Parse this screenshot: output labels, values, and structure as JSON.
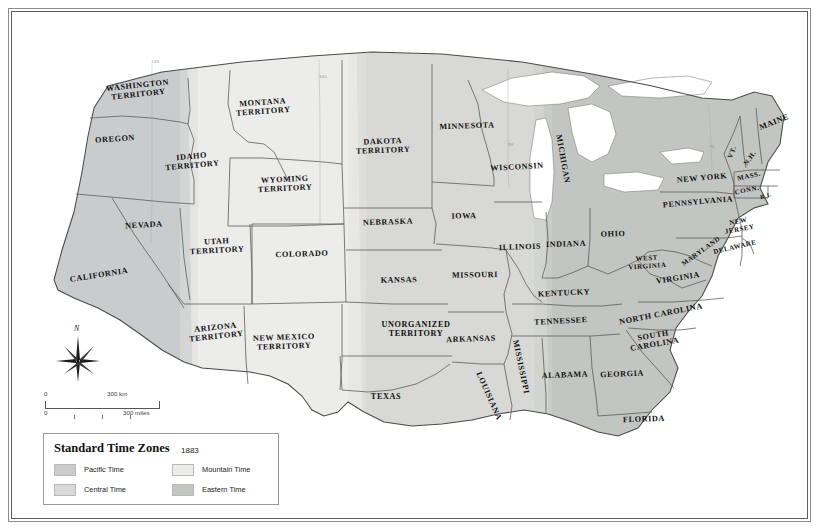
{
  "legend": {
    "title": "Standard Time Zones",
    "year": "1883",
    "entries": [
      {
        "label": "Pacific Time",
        "color": "#c9cbcc"
      },
      {
        "label": "Mountain Time",
        "color": "#ececea"
      },
      {
        "label": "Central Time",
        "color": "#d8d9d6"
      },
      {
        "label": "Eastern Time",
        "color": "#c3c5c2"
      }
    ]
  },
  "scale_bar": {
    "km_zero": "0",
    "km_value": "300 km",
    "miles_zero": "0",
    "miles_value": "300 miles"
  },
  "compass": {
    "north_label": "N"
  },
  "meridians": [
    {
      "label": "120",
      "x": 139,
      "y": 47
    },
    {
      "label": "105",
      "x": 307,
      "y": 62
    },
    {
      "label": "90",
      "x": 496,
      "y": 130
    },
    {
      "label": "75",
      "x": 697,
      "y": 132
    }
  ],
  "colors": {
    "ocean": "#ffffff",
    "pacific": "#c9cbcc",
    "mountain": "#ececea",
    "central": "#d8d9d6",
    "eastern": "#c3c5c2",
    "border": "#5a5a5a",
    "frame_outer": "#8c8c8c",
    "frame_inner": "#5d5d5d",
    "label_text": "#111111"
  },
  "chart_data": {
    "type": "map",
    "title": "Standard Time Zones 1883",
    "projection": "conic (contiguous United States)",
    "zones": [
      {
        "name": "Pacific Time",
        "color": "#c9cbcc",
        "members": [
          "Washington Territory",
          "Oregon",
          "California",
          "Nevada (western)"
        ]
      },
      {
        "name": "Mountain Time",
        "color": "#ececea",
        "members": [
          "Idaho Territory",
          "Montana Territory",
          "Wyoming Territory",
          "Utah Territory",
          "Colorado",
          "Arizona Territory",
          "New Mexico Territory",
          "Nevada (eastern)"
        ]
      },
      {
        "name": "Central Time",
        "color": "#d8d9d6",
        "members": [
          "Dakota Territory",
          "Nebraska",
          "Kansas",
          "Unorganized Territory",
          "Texas",
          "Minnesota",
          "Iowa",
          "Missouri",
          "Arkansas",
          "Louisiana",
          "Wisconsin",
          "Illinois",
          "Mississippi",
          "Alabama"
        ]
      },
      {
        "name": "Eastern Time",
        "color": "#c3c5c2",
        "members": [
          "Michigan",
          "Indiana",
          "Ohio",
          "Kentucky",
          "Tennessee",
          "Georgia",
          "Florida",
          "South Carolina",
          "North Carolina",
          "Virginia",
          "West Virginia",
          "Maryland",
          "Delaware",
          "Pennsylvania",
          "New Jersey",
          "New York",
          "Connecticut",
          "Rhode Island",
          "Massachusetts",
          "Vermont",
          "New Hampshire",
          "Maine"
        ]
      }
    ],
    "meridian_ticks": [
      "120",
      "105",
      "90",
      "75"
    ],
    "scale": {
      "km": 300,
      "miles": 300
    }
  },
  "regions": [
    {
      "name": "WASHINGTON\nTERRITORY",
      "x": 126,
      "y": 78,
      "rot": -6,
      "size": "sz"
    },
    {
      "name": "OREGON",
      "x": 103,
      "y": 127,
      "rot": -4,
      "size": "sz"
    },
    {
      "name": "IDAHO\nTERRITORY",
      "x": 180,
      "y": 149,
      "rot": -5,
      "size": "sz"
    },
    {
      "name": "MONTANA\nTERRITORY",
      "x": 251,
      "y": 95,
      "rot": -4,
      "size": "sz"
    },
    {
      "name": "WYOMING\nTERRITORY",
      "x": 273,
      "y": 172,
      "rot": -3,
      "size": "sz"
    },
    {
      "name": "NEVADA",
      "x": 132,
      "y": 213,
      "rot": -3,
      "size": "sz"
    },
    {
      "name": "CALIFORNIA",
      "x": 87,
      "y": 263,
      "rot": -9,
      "size": "sz"
    },
    {
      "name": "UTAH\nTERRITORY",
      "x": 205,
      "y": 234,
      "rot": -3,
      "size": "sz"
    },
    {
      "name": "COLORADO",
      "x": 290,
      "y": 242,
      "rot": -2,
      "size": "sz"
    },
    {
      "name": "ARIZONA\nTERRITORY",
      "x": 204,
      "y": 320,
      "rot": -6,
      "size": "sz"
    },
    {
      "name": "NEW MEXICO\nTERRITORY",
      "x": 272,
      "y": 330,
      "rot": -2,
      "size": "sz"
    },
    {
      "name": "DAKOTA\nTERRITORY",
      "x": 371,
      "y": 134,
      "rot": -2,
      "size": "sz"
    },
    {
      "name": "NEBRASKA",
      "x": 376,
      "y": 210,
      "rot": -2,
      "size": "sz"
    },
    {
      "name": "KANSAS",
      "x": 387,
      "y": 268,
      "rot": -1,
      "size": "sz"
    },
    {
      "name": "UNORGANIZED\nTERRITORY",
      "x": 404,
      "y": 317,
      "rot": 0,
      "size": "sz"
    },
    {
      "name": "TEXAS",
      "x": 374,
      "y": 385,
      "rot": 0,
      "size": "sz"
    },
    {
      "name": "MINNESOTA",
      "x": 455,
      "y": 114,
      "rot": -2,
      "size": "sz"
    },
    {
      "name": "IOWA",
      "x": 452,
      "y": 204,
      "rot": -1,
      "size": "sz"
    },
    {
      "name": "MISSOURI",
      "x": 463,
      "y": 263,
      "rot": -1,
      "size": "sz"
    },
    {
      "name": "ARKANSAS",
      "x": 459,
      "y": 327,
      "rot": -2,
      "size": "sz"
    },
    {
      "name": "WISCONSIN",
      "x": 505,
      "y": 155,
      "rot": -3,
      "size": "sz"
    },
    {
      "name": "ILLINOIS",
      "x": 508,
      "y": 235,
      "rot": -2,
      "size": "sz"
    },
    {
      "name": "INDIANA",
      "x": 554,
      "y": 232,
      "rot": -2,
      "size": "sz"
    },
    {
      "name": "MICHIGAN",
      "x": 551,
      "y": 147,
      "rot": 80,
      "size": "sz"
    },
    {
      "name": "OHIO",
      "x": 601,
      "y": 222,
      "rot": -2,
      "size": "sz"
    },
    {
      "name": "KENTUCKY",
      "x": 552,
      "y": 281,
      "rot": -3,
      "size": "sz"
    },
    {
      "name": "TENNESSEE",
      "x": 549,
      "y": 309,
      "rot": -3,
      "size": "sz"
    },
    {
      "name": "MISSISSIPPI",
      "x": 509,
      "y": 355,
      "rot": 78,
      "size": "sz"
    },
    {
      "name": "LOUISIANA",
      "x": 477,
      "y": 384,
      "rot": 66,
      "size": "sz"
    },
    {
      "name": "ALABAMA",
      "x": 553,
      "y": 363,
      "rot": -2,
      "size": "sz"
    },
    {
      "name": "GEORGIA",
      "x": 610,
      "y": 362,
      "rot": -2,
      "size": "sz"
    },
    {
      "name": "FLORIDA",
      "x": 632,
      "y": 407,
      "rot": -2,
      "size": "sz"
    },
    {
      "name": "SOUTH\nCAROLINA",
      "x": 642,
      "y": 328,
      "rot": -10,
      "size": "sz"
    },
    {
      "name": "NORTH CAROLINA",
      "x": 649,
      "y": 302,
      "rot": -11,
      "size": "sz"
    },
    {
      "name": "VIRGINIA",
      "x": 666,
      "y": 266,
      "rot": -9,
      "size": "sz"
    },
    {
      "name": "WEST\nVIRGINIA",
      "x": 635,
      "y": 250,
      "rot": -4,
      "size": "sz-sm"
    },
    {
      "name": "MARYLAND",
      "x": 689,
      "y": 239,
      "rot": -36,
      "size": "sz-sm"
    },
    {
      "name": "DELAWARE",
      "x": 723,
      "y": 235,
      "rot": -13,
      "size": "sz-sm"
    },
    {
      "name": "PENNSYLVANIA",
      "x": 686,
      "y": 190,
      "rot": -5,
      "size": "sz"
    },
    {
      "name": "NEW\nJERSEY",
      "x": 727,
      "y": 213,
      "rot": -10,
      "size": "sz-sm"
    },
    {
      "name": "NEW YORK",
      "x": 690,
      "y": 166,
      "rot": -5,
      "size": "sz"
    },
    {
      "name": "VT.",
      "x": 720,
      "y": 140,
      "rot": -68,
      "size": "sz-sm"
    },
    {
      "name": "N.H.",
      "x": 738,
      "y": 146,
      "rot": -54,
      "size": "sz-sm"
    },
    {
      "name": "MAINE",
      "x": 762,
      "y": 110,
      "rot": -22,
      "size": "sz"
    },
    {
      "name": "MASS.",
      "x": 737,
      "y": 164,
      "rot": -12,
      "size": "sz-sm"
    },
    {
      "name": "CONN.",
      "x": 735,
      "y": 178,
      "rot": -12,
      "size": "sz-sm"
    },
    {
      "name": "R.I.",
      "x": 754,
      "y": 184,
      "rot": -16,
      "size": "sz-xs"
    }
  ]
}
